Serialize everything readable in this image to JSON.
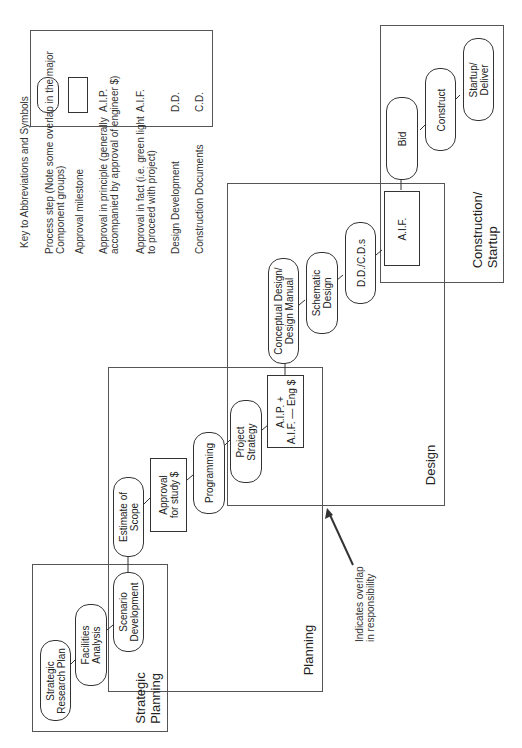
{
  "legend": {
    "title": "Key to Abbreviations and Symbols",
    "items": [
      {
        "symbol": "rounded-rect",
        "text": "Process step (Note some overlap in the major\nComponent groups)"
      },
      {
        "symbol": "rect",
        "text": "Approval milestone"
      },
      {
        "abbr": "A.I.P.",
        "text": "Approval in principle (generally\naccompanied by approval of engineer $)"
      },
      {
        "abbr": "A.I.F.",
        "text": "Approval in fact (i.e. green light\nto proceed with project)"
      },
      {
        "abbr": "D.D.",
        "text": "Design Development"
      },
      {
        "abbr": "C.D.",
        "text": "Construction Documents"
      }
    ]
  },
  "groups": {
    "strategic_planning": {
      "label": "Strategic\nPlanning",
      "steps": [
        "Strategic\nResearch Plan",
        "Facilities\nAnalysis",
        "Scenario\nDevelopment"
      ]
    },
    "planning": {
      "label": "Planning",
      "steps": [
        "Estimate of\nScope",
        "Approval\nfor study $",
        "Programming",
        "Project\nStrategy",
        "A.I.P. +\nA.I.F. — Eng $"
      ]
    },
    "design": {
      "label": "Design",
      "steps": [
        "Conceptual Design/\nDesign Manual",
        "Schematic\nDesign",
        "D.D./C.D.s",
        "A.I.F."
      ]
    },
    "construction": {
      "label": "Construction/\nStartup",
      "steps": [
        "Bid",
        "Construct",
        "Startup/\nDeliver"
      ]
    }
  },
  "annotation": {
    "text": "Indicates overlap\nin responsibility"
  },
  "colors": {
    "line": "#333333",
    "box_border": "#555555",
    "background": "#ffffff"
  }
}
